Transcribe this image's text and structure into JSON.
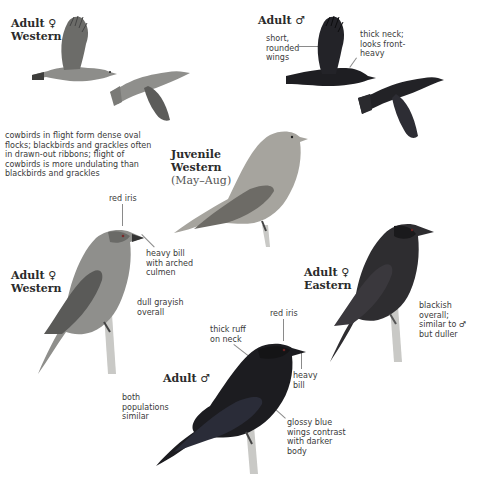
{
  "plate": {
    "subject": "Bronzed Cowbird",
    "groups": [
      {
        "id": "flight-female-western",
        "label": "Adult ♀",
        "sublabel": "Western",
        "notes": []
      },
      {
        "id": "flight-male",
        "label": "Adult ♂",
        "sublabel": "",
        "notes": [
          "short,\nrounded\nwings",
          "thick neck;\nlooks front-\nheavy"
        ]
      },
      {
        "id": "flight-note",
        "notes": [
          "cowbirds in flight form dense oval\nflocks; blackbirds and grackles often\nin drawn-out ribbons; flight of\ncowbirds is more undulating than\nblackbirds and grackles"
        ]
      },
      {
        "id": "juvenile-western",
        "label": "Juvenile",
        "sublabel": "Western",
        "season": "(May–Aug)",
        "notes": []
      },
      {
        "id": "perched-female-western",
        "label": "Adult ♀",
        "sublabel": "Western",
        "notes": [
          "red iris",
          "heavy bill\nwith arched\nculmen",
          "dull grayish\noverall"
        ]
      },
      {
        "id": "perched-female-eastern",
        "label": "Adult ♀",
        "sublabel": "Eastern",
        "notes": [
          "blackish overall;\nsimilar to ♂\nbut duller"
        ]
      },
      {
        "id": "perched-male",
        "label": "Adult ♂",
        "sublabel": "",
        "notes": [
          "red iris",
          "thick ruff\non neck",
          "heavy\nbill",
          "both\npopulations\nsimilar",
          "glossy blue\nwings contrast\nwith darker\nbody"
        ]
      }
    ]
  },
  "colors": {
    "background": "#ffffff",
    "female_gray": "#8d8d8a",
    "female_gray_dark": "#5e5e5c",
    "juvenile": "#a6a49e",
    "male_black": "#1e1e22",
    "eastern_female": "#2e2d30",
    "perch": "#c9c9c6",
    "leader": "#8a8a8a"
  }
}
